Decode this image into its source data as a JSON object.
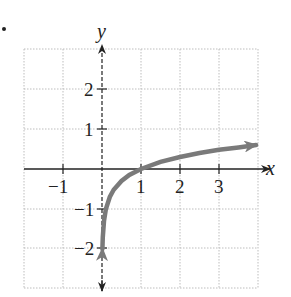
{
  "chart_data": {
    "type": "line",
    "title": "",
    "function": "y = log10(x)",
    "xlabel": "x",
    "ylabel": "y",
    "xlim": [
      -2,
      4
    ],
    "ylim": [
      -3,
      3
    ],
    "grid": true,
    "grid_style": "dotted",
    "x_ticks": [
      -1,
      1,
      2,
      3
    ],
    "x_tick_labels": [
      "−1",
      "1",
      "2",
      "3"
    ],
    "y_ticks": [
      -2,
      -1,
      1,
      2
    ],
    "y_tick_labels": [
      "−2",
      "−1",
      "1",
      "2"
    ],
    "asymptote": {
      "type": "vertical",
      "x": 0,
      "style": "dashed"
    },
    "series": [
      {
        "name": "curve",
        "color": "#7a7a7a",
        "x": [
          0.01,
          0.02,
          0.05,
          0.1,
          0.2,
          0.3,
          0.5,
          0.7,
          1,
          1.5,
          2,
          2.5,
          3,
          3.5,
          3.95
        ],
        "y": [
          -2.0,
          -1.7,
          -1.3,
          -1.0,
          -0.7,
          -0.52,
          -0.3,
          -0.15,
          0,
          0.18,
          0.3,
          0.4,
          0.48,
          0.54,
          0.6
        ]
      }
    ],
    "legend": null
  },
  "labels": {
    "x_axis": "x",
    "y_axis": "y",
    "xt_m1": "−1",
    "xt_1": "1",
    "xt_2": "2",
    "xt_3": "3",
    "yt_2": "2",
    "yt_1": "1",
    "yt_m1": "−1",
    "yt_m2": "−2"
  }
}
